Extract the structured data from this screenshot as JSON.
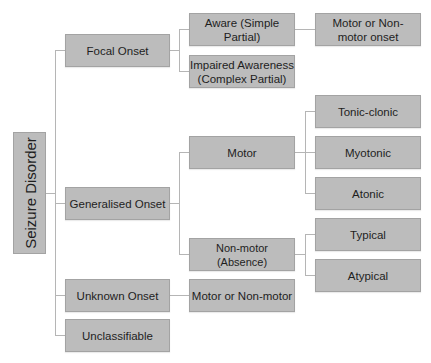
{
  "diagram": {
    "root": "Seizure Disorder",
    "level1": {
      "focal": "Focal Onset",
      "generalised": "Generalised Onset",
      "unknown": "Unknown Onset",
      "unclassifiable": "Unclassifiable"
    },
    "level2": {
      "aware": "Aware (Simple Partial)",
      "impaired": "Impaired Awareness (Complex Partial)",
      "motor": "Motor",
      "nonmotor": "Non-motor (Absence)",
      "unknown_motor": "Motor or Non-motor"
    },
    "level3": {
      "aware_onset": "Motor or Non-motor onset",
      "tonic_clonic": "Tonic-clonic",
      "myotonic": "Myotonic",
      "atonic": "Atonic",
      "typical": "Typical",
      "atypical": "Atypical"
    },
    "colors": {
      "box": "#bcbcbc",
      "border": "#a3a3a3",
      "line": "#b5b5b5"
    }
  }
}
